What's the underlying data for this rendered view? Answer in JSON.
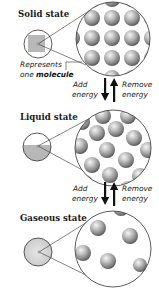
{
  "diagram": {
    "states": [
      {
        "title": "Solid state",
        "inset_fill": "solid-square"
      },
      {
        "title": "Liquid state",
        "inset_fill": "lower-half"
      },
      {
        "title": "Gaseous state",
        "inset_fill": "speckled-full"
      }
    ],
    "annotation": {
      "line1": "Represents",
      "line2_prefix": "one ",
      "line2_bold": "molecule"
    },
    "transitions": [
      {
        "add_line1": "Add",
        "add_line2": "energy",
        "remove_line1": "Remove",
        "remove_line2": "energy"
      },
      {
        "add_line1": "Add",
        "add_line2": "energy",
        "remove_line1": "Remove",
        "remove_line2": "energy"
      }
    ],
    "icons": {
      "down_arrow": "arrow-down-icon",
      "up_arrow": "arrow-up-icon"
    },
    "colors": {
      "sphere_light": "#f2f2f2",
      "sphere_mid": "#9a9a9a",
      "sphere_dark": "#4a4a4a",
      "inset_gray": "#b8b8b8",
      "outline": "#333333"
    }
  }
}
